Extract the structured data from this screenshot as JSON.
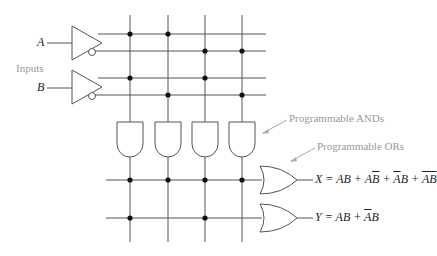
{
  "labels": {
    "input_a": "A",
    "input_b": "B",
    "inputs": "Inputs",
    "programmable_ands": "Programmable ANDs",
    "programmable_ors": "Programmable ORs"
  },
  "outputs": {
    "x": {
      "name": "X",
      "terms": [
        "AB",
        "A̅B̅"
      ],
      "expression": "X = AB + AB̅ + A̅B + A̅B̅"
    },
    "y": {
      "name": "Y",
      "expression": "Y = AB + A̅B"
    }
  },
  "eq_x": {
    "prefix": "X = AB + A",
    "b1": "B",
    "mid1": " + ",
    "a2": "A",
    "mid2": "B + ",
    "a3": "A",
    "b3": "B"
  },
  "eq_y": {
    "prefix": "Y = AB + ",
    "a": "A",
    "suffix": "B"
  },
  "colors": {
    "wire": "#555555",
    "dot": "#111111",
    "label": "#999999"
  }
}
